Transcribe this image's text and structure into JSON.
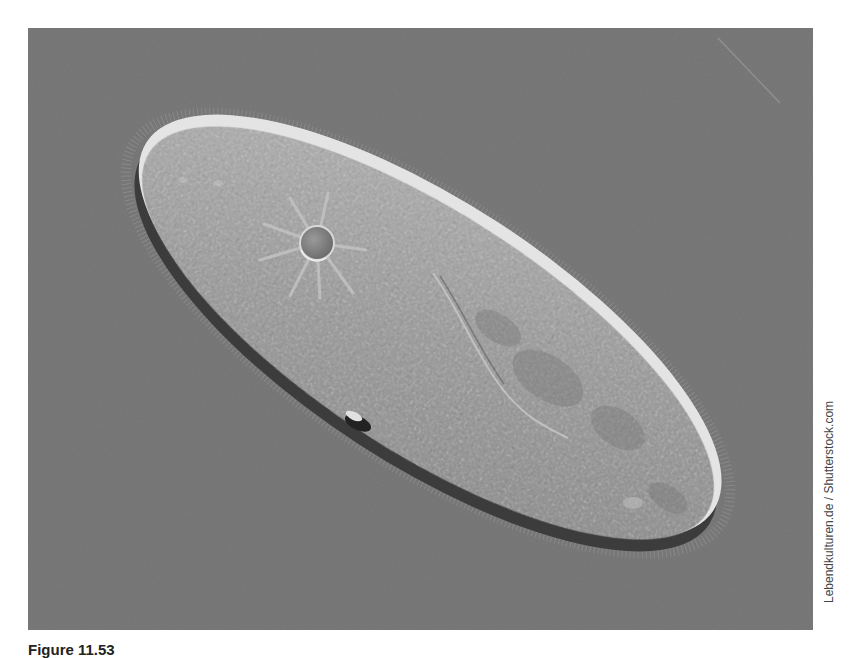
{
  "figure": {
    "background_color": "#7a7a7a",
    "cell_color": "#a6a6a6",
    "highlight_color": "#e8e8e8",
    "shadow_color": "#3a3a3a",
    "features": [
      {
        "name": "contractile-vacuole",
        "cx": 289,
        "cy": 215
      },
      {
        "name": "oral-groove",
        "cx": 460,
        "cy": 330
      },
      {
        "name": "cell-defect",
        "cx": 340,
        "cy": 395
      }
    ]
  },
  "credit": "Lebendkulturen.de / Shutterstock.com",
  "caption": {
    "label": "Figure 11.53",
    "text": ""
  }
}
